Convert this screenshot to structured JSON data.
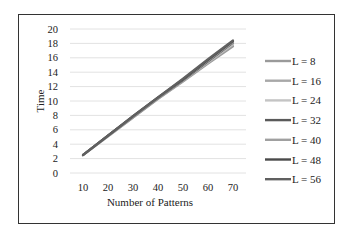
{
  "chart_data": {
    "type": "line",
    "title": "",
    "xlabel": "Number of Patterns",
    "ylabel": "Time",
    "x": [
      10,
      20,
      30,
      40,
      50,
      60,
      70
    ],
    "ylim": [
      0,
      20
    ],
    "yticks": [
      0,
      2,
      4,
      6,
      8,
      10,
      12,
      14,
      16,
      18,
      20
    ],
    "xticks": [
      10,
      20,
      30,
      40,
      50,
      60,
      70
    ],
    "grid": "horizontal",
    "legend_position": "right",
    "series": [
      {
        "name": "L = 8",
        "color": "#9a9a9a",
        "values": [
          2.5,
          5.1,
          7.7,
          10.3,
          12.7,
          15.2,
          17.6
        ]
      },
      {
        "name": "L = 16",
        "color": "#a8a8a8",
        "values": [
          2.5,
          5.1,
          7.7,
          10.3,
          12.8,
          15.3,
          17.8
        ]
      },
      {
        "name": "L = 24",
        "color": "#c4c4c4",
        "values": [
          2.5,
          5.2,
          7.8,
          10.4,
          12.9,
          15.4,
          17.9
        ]
      },
      {
        "name": "L = 32",
        "color": "#5a5a5a",
        "values": [
          2.5,
          5.2,
          7.8,
          10.4,
          12.9,
          15.5,
          18.1
        ]
      },
      {
        "name": "L = 40",
        "color": "#a0a0a0",
        "values": [
          2.5,
          5.2,
          7.8,
          10.4,
          13.0,
          15.6,
          18.2
        ]
      },
      {
        "name": "L = 48",
        "color": "#4a4a4a",
        "values": [
          2.5,
          5.2,
          7.9,
          10.5,
          13.0,
          15.7,
          18.3
        ]
      },
      {
        "name": "L = 56",
        "color": "#606060",
        "values": [
          2.5,
          5.2,
          7.9,
          10.5,
          13.1,
          15.8,
          18.4
        ]
      }
    ]
  }
}
